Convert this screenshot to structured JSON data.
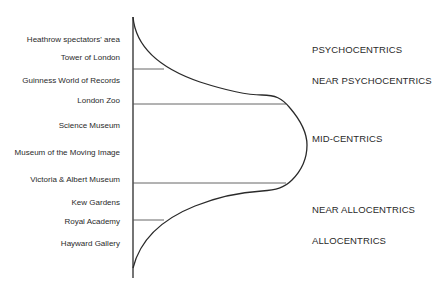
{
  "diagram": {
    "type": "tourist-segmentation-curve",
    "attractions": [
      {
        "label": "Heathrow spectators' area",
        "y": 40
      },
      {
        "label": "Tower of London",
        "y": 58
      },
      {
        "label": "Guinness World of Records",
        "y": 81
      },
      {
        "label": "London Zoo",
        "y": 101
      },
      {
        "label": "Science Museum",
        "y": 126
      },
      {
        "label": "Museum of the Moving Image",
        "y": 153
      },
      {
        "label": "Victoria & Albert Museum",
        "y": 180
      },
      {
        "label": "Kew Gardens",
        "y": 203
      },
      {
        "label": "Royal Academy",
        "y": 222
      },
      {
        "label": "Hayward Gallery",
        "y": 244
      }
    ],
    "segments": [
      {
        "label": "PSYCHOCENTRICS",
        "y": 44
      },
      {
        "label": "NEAR PSYCHOCENTRICS",
        "y": 75
      },
      {
        "label": "MID-CENTRICS",
        "y": 133
      },
      {
        "label": "NEAR ALLOCENTRICS",
        "y": 205
      },
      {
        "label": "ALLOCENTRICS",
        "y": 236
      }
    ],
    "colors": {
      "line": "#2a2a2a",
      "divider": "#555555",
      "text": "#2a2a2a"
    }
  }
}
